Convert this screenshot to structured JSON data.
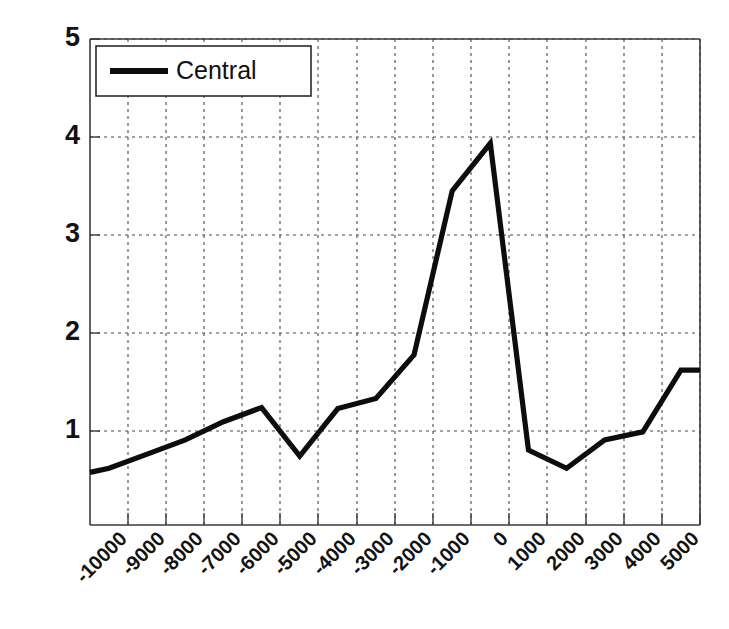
{
  "chart_data": {
    "type": "line",
    "title": "",
    "xlabel": "",
    "ylabel": "",
    "xlim": [
      -10500,
      5500
    ],
    "ylim": [
      0.2,
      5
    ],
    "grid": true,
    "legend_position": "top-left",
    "x_tick_labels": [
      "-10000",
      "-9000",
      "-8000",
      "-7000",
      "-6000",
      "-5000",
      "-4000",
      "-3000",
      "-2000",
      "-1000",
      "0",
      "1000",
      "2000",
      "3000",
      "4000",
      "5000"
    ],
    "x_tick_values": [
      -10000,
      -9000,
      -8000,
      -7000,
      -6000,
      -5000,
      -4000,
      -3000,
      -2000,
      -1000,
      0,
      1000,
      2000,
      3000,
      4000,
      5000
    ],
    "y_tick_labels": [
      "1",
      "2",
      "3",
      "4",
      "5"
    ],
    "y_tick_values": [
      1,
      2,
      3,
      4,
      5
    ],
    "x": [
      -10500,
      -10000,
      -9000,
      -8000,
      -7000,
      -6000,
      -5000,
      -4000,
      -3000,
      -2000,
      -1000,
      0,
      1000,
      2000,
      3000,
      4000,
      5000,
      5500
    ],
    "series": [
      {
        "name": "Central",
        "color": "#0d0d0d",
        "values": [
          0.72,
          0.76,
          0.9,
          1.04,
          1.22,
          1.36,
          0.88,
          1.35,
          1.45,
          1.88,
          3.5,
          3.97,
          0.94,
          0.76,
          1.04,
          1.12,
          1.73,
          1.73
        ]
      }
    ]
  },
  "legend": {
    "entries": [
      {
        "label": "Central"
      }
    ]
  },
  "axes": {
    "y_labels": [
      "5",
      "4",
      "3",
      "2",
      "1"
    ],
    "x_labels": [
      "-10000",
      "-9000",
      "-8000",
      "-7000",
      "-6000",
      "-5000",
      "-4000",
      "-3000",
      "-2000",
      "-1000",
      "0",
      "1000",
      "2000",
      "3000",
      "4000",
      "5000"
    ]
  }
}
